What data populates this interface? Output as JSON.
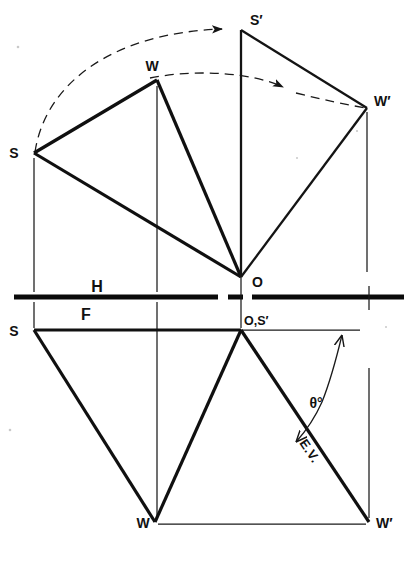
{
  "figure": {
    "background_color": "#ffffff",
    "ink_color": "#101010"
  },
  "labels": {
    "top_view": {
      "s": "S",
      "w": "W",
      "o": "O",
      "s_prime": "S′",
      "w_prime": "W′"
    },
    "front_view": {
      "s": "S",
      "w": "W",
      "w_prime": "W′",
      "o_s_prime": "O,S′"
    },
    "planes": {
      "horizontal": "H",
      "frontal": "F"
    },
    "annotations": {
      "angle": "θ°",
      "edge_view": "E.V."
    }
  },
  "geometry": {
    "fold_line_y": 297,
    "top_view": {
      "S": [
        34,
        153
      ],
      "W": [
        157,
        80
      ],
      "O": [
        241,
        277
      ],
      "S_prime": [
        241,
        30
      ],
      "W_prime": [
        367,
        108
      ]
    },
    "front_view": {
      "S": [
        34,
        330
      ],
      "O_S_prime": [
        241,
        330
      ],
      "W": [
        155,
        522
      ],
      "W_prime": [
        369,
        522
      ]
    }
  },
  "elements": {
    "triangle_top_view": "S-W-O",
    "revolved_triangle": "S′-W′-O",
    "triangle_front_view": "S-W-O,S′",
    "revolved_front": "O,S′-W′",
    "arc_outer": "S to S′",
    "arc_inner": "W to W′",
    "reference_line_front": "O,S′ to right",
    "baseline_front": "W to W′"
  },
  "colors": {
    "line": "#101010",
    "thin_line": "#1a1a1a",
    "paper": "#ffffff"
  }
}
